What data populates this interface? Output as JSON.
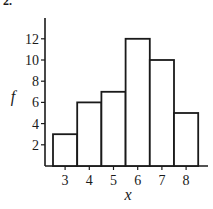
{
  "figure": {
    "corner_label": "2."
  },
  "chart_data": {
    "type": "bar",
    "title": "",
    "xlabel": "x",
    "ylabel": "f",
    "categories": [
      "3",
      "4",
      "5",
      "6",
      "7",
      "8"
    ],
    "values": [
      3,
      6,
      7,
      12,
      10,
      5
    ],
    "y_ticks": [
      "2",
      "4",
      "6",
      "8",
      "10",
      "12"
    ],
    "x_ticks": [
      "3",
      "4",
      "5",
      "6",
      "7",
      "8"
    ],
    "ylim": [
      0,
      14
    ],
    "grid": false,
    "legend": null,
    "bar_style": "histogram (adjacent outlined bars, white fill, black stroke)"
  }
}
